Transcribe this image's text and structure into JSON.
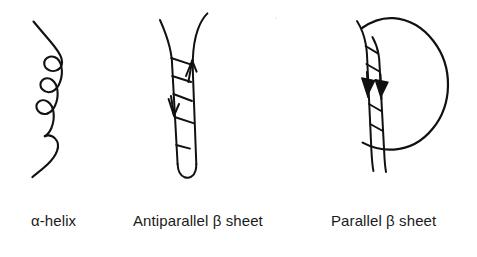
{
  "figure": {
    "background_color": "#ffffff",
    "ink_color": "#111111",
    "panels": [
      {
        "id": "alpha-helix",
        "label": "α-helix",
        "structure_type": "alpha helix",
        "description": "Hand-drawn continuous coiled ribbon with three loops of a spiral, free ends at top and bottom",
        "loop_count": 3
      },
      {
        "id": "antiparallel-beta-sheet",
        "label": "Antiparallel β sheet",
        "structure_type": "antiparallel beta sheet",
        "description": "Two adjacent strands joined at the bottom by a hairpin turn, cross hatched hydrogen bond rungs, arrowheads pointing in opposite directions",
        "strand_count": 2,
        "rung_count": 5,
        "arrow_directions": [
          "down",
          "up"
        ]
      },
      {
        "id": "parallel-beta-sheet",
        "label": "Parallel β sheet",
        "structure_type": "parallel beta sheet",
        "description": "Two adjacent strands joined by a large crossover loop on the right, cross hatched hydrogen bond rungs, two solid arrowheads both pointing down",
        "strand_count": 2,
        "rung_count": 4,
        "arrow_directions": [
          "down",
          "down"
        ]
      }
    ]
  },
  "captions": {
    "alpha_helix": "α-helix",
    "antiparallel_beta_sheet": "Antiparallel β sheet",
    "parallel_beta_sheet": "Parallel β sheet"
  }
}
